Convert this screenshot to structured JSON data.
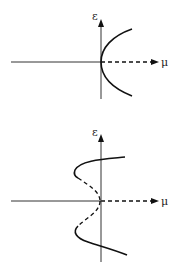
{
  "diagrams": [
    {
      "name": "supercritical-pitchfork",
      "y_axis_label": "ε",
      "x_axis_label": "μ",
      "description": "Parabolic branch opening to the right, solid (stable); trivial branch dashed for μ>0"
    },
    {
      "name": "subcritical-with-turning-points",
      "y_axis_label": "ε",
      "x_axis_label": "μ",
      "description": "S-shaped branches: solid outer branches, dashed inner branches folding back to origin; trivial branch dashed for μ>0"
    }
  ],
  "colors": {
    "line": "#111111",
    "axis": "#333333",
    "background": "#ffffff"
  }
}
